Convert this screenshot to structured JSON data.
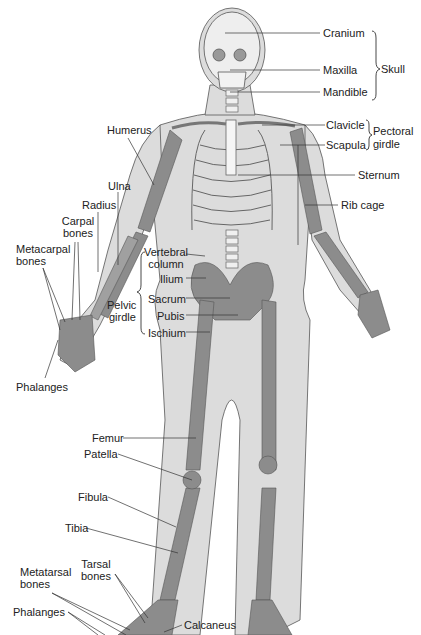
{
  "diagram": {
    "type": "anatomical-skeleton",
    "colors": {
      "background": "#ffffff",
      "skin": "#d9d9d9",
      "bone": "#8a8a8a",
      "bone_light": "#ececec",
      "outline": "#555555",
      "leader": "#333333",
      "text": "#222222"
    },
    "labels": {
      "cranium": "Cranium",
      "maxilla": "Maxilla",
      "mandible": "Mandible",
      "skull": "Skull",
      "clavicle": "Clavicle",
      "scapula": "Scapula",
      "pectoral_1": "Pectoral",
      "pectoral_2": "girdle",
      "sternum": "Sternum",
      "rib_cage": "Rib cage",
      "humerus": "Humerus",
      "ulna": "Ulna",
      "radius": "Radius",
      "carpal_1": "Carpal",
      "carpal_2": "bones",
      "metacarpal_1": "Metacarpal",
      "metacarpal_2": "bones",
      "vertebral_1": "Vertebral",
      "vertebral_2": "column",
      "ilium": "Ilium",
      "sacrum": "Sacrum",
      "pubis": "Pubis",
      "ischium": "Ischium",
      "pelvic_1": "Pelvic",
      "pelvic_2": "girdle",
      "phalanges_hand": "Phalanges",
      "femur": "Femur",
      "patella": "Patella",
      "fibula": "Fibula",
      "tibia": "Tibia",
      "tarsal_1": "Tarsal",
      "tarsal_2": "bones",
      "metatarsal_1": "Metatarsal",
      "metatarsal_2": "bones",
      "phalanges_foot": "Phalanges",
      "calcaneus": "Calcaneus"
    }
  }
}
